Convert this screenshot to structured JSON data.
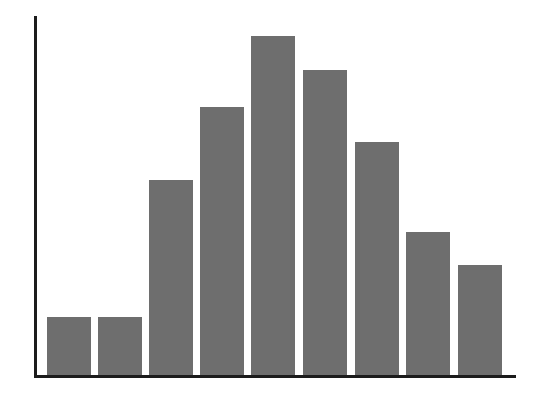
{
  "chart_data": {
    "type": "bar",
    "title": "",
    "subtitle": "",
    "xlabel": "",
    "ylabel": "",
    "categories": [
      "1",
      "2",
      "3",
      "4",
      "5",
      "6",
      "7",
      "8",
      "9"
    ],
    "values": [
      59,
      59,
      196,
      269,
      340,
      306,
      234,
      144,
      111
    ],
    "values_normalized_pct": [
      17,
      17,
      58,
      79,
      100,
      90,
      69,
      42,
      33
    ],
    "ylim": [
      0,
      360
    ],
    "grid": false,
    "legend": null,
    "legend_position": "none",
    "tick_labels_x": [],
    "tick_labels_y": [],
    "annotations": [],
    "series": [
      {
        "name": "",
        "values": [
          59,
          59,
          196,
          269,
          340,
          306,
          234,
          144,
          111
        ]
      }
    ],
    "bar_geometry": {
      "plot_left_px": 35,
      "plot_top_px": 16,
      "plot_width_px": 480,
      "plot_height_px": 360,
      "bar_width_px": 44,
      "bar_gap_px": 7,
      "first_bar_left_px": 12,
      "bar_lefts_px": [
        12,
        63,
        114,
        165,
        216,
        268,
        320,
        371,
        423
      ],
      "bar_tops_px": [
        317,
        317,
        180,
        107,
        36,
        70,
        142,
        232,
        265
      ]
    }
  },
  "style": {
    "bar_color": "#6e6e6e",
    "axis_color": "#1c1c1c",
    "background_color": "#ffffff"
  }
}
